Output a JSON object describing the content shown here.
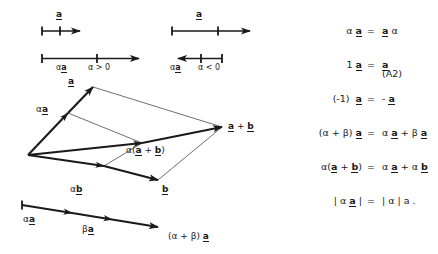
{
  "figure": {
    "scalar_lines": {
      "left": {
        "top_vector_label": "a",
        "bottom_label_scaled": "αa",
        "bottom_label_condition": "α > 0",
        "direction": "right"
      },
      "right": {
        "top_vector_label": "a",
        "bottom_label_scaled": "αa",
        "bottom_label_condition": "α < 0",
        "direction": "left"
      }
    },
    "parallelogram": {
      "labels": {
        "a": "a",
        "alpha_a": "αa",
        "alpha_b": "αb",
        "b": "b",
        "a_plus_b": "a + b",
        "alpha_a_plus_b": "α(a + b)"
      }
    },
    "distributive_line": {
      "alpha_a": "αa",
      "beta_a": "βa",
      "sum": "(α + β) a"
    }
  },
  "equations": {
    "tag": "(A2)",
    "rows": [
      {
        "lhs": "α a",
        "eq": "=",
        "rhs": "a α"
      },
      {
        "lhs": "1 a",
        "eq": "=",
        "rhs": "a"
      },
      {
        "lhs": "(-1)  a",
        "eq": "=",
        "rhs": "-  a"
      },
      {
        "lhs": "(α + β)  a",
        "eq": "=",
        "rhs": "α a + β a"
      },
      {
        "lhs": "α(a + b)",
        "eq": "=",
        "rhs": "α a + α b"
      },
      {
        "lhs": "| α a |",
        "eq": "=",
        "rhs": "| α | a ."
      }
    ]
  },
  "colors": {
    "ink": "#1a1a1a",
    "thin_line": "#5a5a5a",
    "background": "#ffffff"
  }
}
